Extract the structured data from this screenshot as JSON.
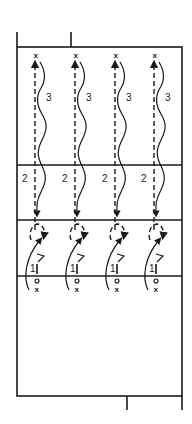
{
  "diagram": {
    "type": "volleyball-drill",
    "colors": {
      "ink": "#1a1a1a",
      "background": "#ffffff"
    },
    "court": {
      "left": 17,
      "right": 182,
      "top": 47,
      "bottom": 396,
      "lines_y": {
        "back_third": 165,
        "attack_line": 220,
        "net": 276
      },
      "top_stubs_x": [
        17,
        71
      ],
      "bottom_stubs_x": [
        127,
        182
      ]
    },
    "lanes": [
      {
        "x": 35,
        "start_marker": "x",
        "end_marker": "x",
        "labels": {
          "step1": "1",
          "step2": "2",
          "step3": "3"
        }
      },
      {
        "x": 75,
        "start_marker": "x",
        "end_marker": "x",
        "labels": {
          "step1": "1",
          "step2": "2",
          "step3": "3"
        }
      },
      {
        "x": 115,
        "start_marker": "x",
        "end_marker": "x",
        "labels": {
          "step1": "1",
          "step2": "2",
          "step3": "3"
        }
      },
      {
        "x": 154,
        "start_marker": "x",
        "end_marker": "x",
        "labels": {
          "step1": "1",
          "step2": "2",
          "step3": "3"
        }
      }
    ]
  }
}
